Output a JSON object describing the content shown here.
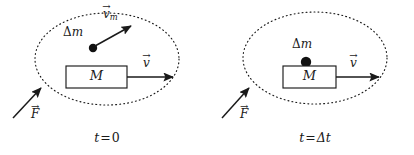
{
  "figure": {
    "background_color": "#ffffff",
    "ink_color": "#1a1a1a"
  },
  "panels": [
    {
      "id": "panel-initial",
      "caption": {
        "time_symbol": "t",
        "equals": "=",
        "time_value": "0",
        "full": "t = 0"
      },
      "boundary": {
        "shape": "ellipse",
        "style": "dotted",
        "cx": 107,
        "cy": 59,
        "rx": 72,
        "ry": 46
      },
      "block": {
        "label": "M",
        "x": 66,
        "y": 66,
        "width": 61,
        "height": 22
      },
      "particle": {
        "label_delta": "Δ",
        "label_mass": "m",
        "label_full": "Δm",
        "cx": 93,
        "cy": 48,
        "r": 4.2
      },
      "vectors": [
        {
          "name": "particle-velocity",
          "symbol": "v",
          "subscript": "m",
          "label_full": "v⃗m",
          "x1": 95,
          "y1": 46,
          "x2": 131,
          "y2": 26
        },
        {
          "name": "block-velocity",
          "symbol": "v",
          "subscript": "",
          "label_full": "v⃗",
          "x1": 127,
          "y1": 77,
          "x2": 173,
          "y2": 77
        },
        {
          "name": "external-force",
          "symbol": "F",
          "subscript": "",
          "label_full": "F⃗",
          "x1": 13,
          "y1": 118,
          "x2": 41,
          "y2": 88
        }
      ]
    },
    {
      "id": "panel-final",
      "caption": {
        "time_symbol": "t",
        "equals": "=",
        "time_value": "Δt",
        "full": "t = Δt"
      },
      "boundary": {
        "shape": "ellipse",
        "style": "dotted",
        "cx": 315,
        "cy": 58,
        "rx": 72,
        "ry": 46
      },
      "block": {
        "label": "M",
        "x": 283,
        "y": 66,
        "width": 53,
        "height": 22
      },
      "particle": {
        "label_delta": "Δ",
        "label_mass": "m",
        "label_full": "Δm",
        "cx": 306,
        "cy": 62,
        "r": 5.2
      },
      "vectors": [
        {
          "name": "block-velocity",
          "symbol": "v",
          "subscript": "",
          "label_full": "v⃗",
          "x1": 336,
          "y1": 77,
          "x2": 379,
          "y2": 77
        },
        {
          "name": "external-force",
          "symbol": "F",
          "subscript": "",
          "label_full": "F⃗",
          "x1": 222,
          "y1": 118,
          "x2": 249,
          "y2": 88
        }
      ]
    }
  ]
}
